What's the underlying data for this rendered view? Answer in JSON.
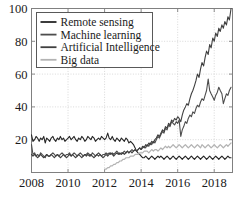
{
  "chart_data": {
    "type": "line",
    "title": "",
    "xlabel": "",
    "ylabel": "",
    "xlim": [
      2008,
      2019
    ],
    "ylim": [
      0,
      100
    ],
    "grid": true,
    "legend_position": "top-left",
    "xticks": [
      "2008",
      "2010",
      "2012",
      "2014",
      "2016",
      "2018"
    ],
    "xtick_values": [
      2008,
      2010,
      2012,
      2014,
      2016,
      2018
    ],
    "yticks": [
      "20",
      "40",
      "60",
      "80",
      "100"
    ],
    "ytick_values": [
      20,
      40,
      60,
      80,
      100
    ],
    "x": [
      2008.0,
      2008.08,
      2008.17,
      2008.25,
      2008.33,
      2008.42,
      2008.5,
      2008.58,
      2008.67,
      2008.75,
      2008.83,
      2008.92,
      2009.0,
      2009.08,
      2009.17,
      2009.25,
      2009.33,
      2009.42,
      2009.5,
      2009.58,
      2009.67,
      2009.75,
      2009.83,
      2009.92,
      2010.0,
      2010.08,
      2010.17,
      2010.25,
      2010.33,
      2010.42,
      2010.5,
      2010.58,
      2010.67,
      2010.75,
      2010.83,
      2010.92,
      2011.0,
      2011.08,
      2011.17,
      2011.25,
      2011.33,
      2011.42,
      2011.5,
      2011.58,
      2011.67,
      2011.75,
      2011.83,
      2011.92,
      2012.0,
      2012.08,
      2012.17,
      2012.25,
      2012.33,
      2012.42,
      2012.5,
      2012.58,
      2012.67,
      2012.75,
      2012.83,
      2012.92,
      2013.0,
      2013.08,
      2013.17,
      2013.25,
      2013.33,
      2013.42,
      2013.5,
      2013.58,
      2013.67,
      2013.75,
      2013.83,
      2013.92,
      2014.0,
      2014.08,
      2014.17,
      2014.25,
      2014.33,
      2014.42,
      2014.5,
      2014.58,
      2014.67,
      2014.75,
      2014.83,
      2014.92,
      2015.0,
      2015.08,
      2015.17,
      2015.25,
      2015.33,
      2015.42,
      2015.5,
      2015.58,
      2015.67,
      2015.75,
      2015.83,
      2015.92,
      2016.0,
      2016.08,
      2016.17,
      2016.25,
      2016.33,
      2016.42,
      2016.5,
      2016.58,
      2016.67,
      2016.75,
      2016.83,
      2016.92,
      2017.0,
      2017.08,
      2017.17,
      2017.25,
      2017.33,
      2017.42,
      2017.5,
      2017.58,
      2017.67,
      2017.75,
      2017.83,
      2017.92,
      2018.0,
      2018.08,
      2018.17,
      2018.25,
      2018.33,
      2018.42,
      2018.5,
      2018.58,
      2018.67,
      2018.75,
      2018.83,
      2018.92
    ],
    "series": [
      {
        "name": "Remote sensing",
        "color": "#262626",
        "width": 1.1,
        "values": [
          23,
          19,
          20,
          22,
          21,
          19,
          21,
          20,
          22,
          18,
          21,
          20,
          19,
          21,
          22,
          20,
          19,
          21,
          20,
          22,
          20,
          21,
          19,
          20,
          21,
          22,
          20,
          21,
          22,
          20,
          19,
          21,
          20,
          22,
          21,
          19,
          20,
          22,
          21,
          20,
          22,
          21,
          19,
          20,
          21,
          20,
          22,
          21,
          20,
          21,
          24,
          21,
          20,
          22,
          20,
          19,
          21,
          20,
          19,
          21,
          20,
          19,
          21,
          20,
          18,
          19,
          18,
          17,
          15,
          13,
          12,
          11,
          10,
          9,
          9,
          10,
          9,
          8,
          9,
          10,
          9,
          8,
          9,
          10,
          9,
          10,
          9,
          8,
          9,
          10,
          9,
          8,
          9,
          10,
          9,
          8,
          9,
          10,
          9,
          8,
          9,
          10,
          9,
          8,
          9,
          10,
          9,
          8,
          9,
          10,
          9,
          8,
          9,
          10,
          9,
          8,
          9,
          10,
          9,
          8,
          9,
          10,
          9,
          8,
          9,
          10,
          9,
          8,
          9,
          10,
          9,
          9
        ]
      },
      {
        "name": "Machine learning",
        "color": "#4d4d4d",
        "width": 1.1,
        "values": [
          17,
          11,
          12,
          10,
          11,
          10,
          12,
          11,
          10,
          9,
          11,
          10,
          10,
          11,
          12,
          11,
          10,
          11,
          10,
          11,
          12,
          11,
          10,
          11,
          11,
          12,
          10,
          11,
          12,
          11,
          10,
          11,
          12,
          11,
          10,
          11,
          11,
          12,
          11,
          10,
          12,
          11,
          10,
          11,
          12,
          11,
          10,
          11,
          11,
          12,
          11,
          12,
          11,
          12,
          11,
          12,
          13,
          12,
          11,
          12,
          12,
          13,
          12,
          13,
          12,
          13,
          14,
          13,
          14,
          13,
          14,
          15,
          14,
          15,
          16,
          15,
          17,
          16,
          18,
          17,
          19,
          18,
          20,
          22,
          21,
          23,
          25,
          24,
          27,
          26,
          29,
          28,
          31,
          30,
          29,
          31,
          30,
          32,
          22,
          26,
          28,
          31,
          30,
          33,
          35,
          34,
          37,
          36,
          39,
          41,
          40,
          43,
          45,
          44,
          47,
          50,
          57,
          50,
          48,
          46,
          44,
          47,
          49,
          52,
          50,
          48,
          42,
          45,
          48,
          47,
          50,
          52
        ]
      },
      {
        "name": "Artificial Intelligence",
        "color": "#404040",
        "width": 1.1,
        "values": [
          11,
          10,
          11,
          10,
          9,
          10,
          11,
          10,
          9,
          10,
          11,
          10,
          10,
          11,
          10,
          9,
          10,
          11,
          10,
          9,
          10,
          11,
          10,
          9,
          10,
          11,
          10,
          11,
          10,
          9,
          10,
          11,
          10,
          9,
          10,
          11,
          10,
          11,
          10,
          11,
          10,
          9,
          10,
          11,
          10,
          11,
          10,
          9,
          10,
          11,
          10,
          11,
          12,
          11,
          10,
          11,
          12,
          11,
          12,
          11,
          12,
          11,
          12,
          13,
          12,
          13,
          12,
          13,
          14,
          13,
          14,
          15,
          14,
          16,
          15,
          17,
          16,
          18,
          17,
          19,
          18,
          20,
          21,
          23,
          22,
          24,
          26,
          25,
          28,
          27,
          30,
          29,
          32,
          31,
          33,
          32,
          34,
          33,
          31,
          35,
          38,
          40,
          42,
          41,
          45,
          48,
          50,
          53,
          56,
          60,
          58,
          63,
          67,
          65,
          70,
          74,
          72,
          78,
          76,
          82,
          80,
          85,
          83,
          88,
          86,
          90,
          88,
          92,
          90,
          95,
          93,
          100
        ]
      },
      {
        "name": "Big data",
        "color": "#b3b3b3",
        "width": 1.2,
        "values": [
          null,
          null,
          null,
          null,
          null,
          null,
          null,
          null,
          null,
          null,
          null,
          null,
          null,
          null,
          null,
          null,
          null,
          null,
          null,
          null,
          null,
          null,
          null,
          null,
          null,
          null,
          null,
          null,
          null,
          null,
          null,
          null,
          null,
          null,
          null,
          null,
          null,
          null,
          null,
          null,
          null,
          null,
          null,
          null,
          null,
          null,
          null,
          null,
          2,
          2,
          3,
          3,
          4,
          4,
          5,
          5,
          6,
          6,
          7,
          7,
          8,
          8,
          9,
          9,
          9,
          10,
          10,
          10,
          11,
          11,
          11,
          12,
          12,
          12,
          13,
          13,
          13,
          12,
          13,
          14,
          13,
          14,
          14,
          13,
          14,
          15,
          14,
          15,
          16,
          15,
          16,
          15,
          16,
          17,
          16,
          15,
          16,
          17,
          16,
          15,
          16,
          17,
          16,
          15,
          16,
          17,
          16,
          15,
          16,
          17,
          16,
          15,
          17,
          16,
          15,
          16,
          17,
          16,
          15,
          16,
          17,
          16,
          15,
          16,
          17,
          16,
          15,
          16,
          17,
          16,
          17,
          18
        ]
      }
    ]
  },
  "legend": {
    "entries": [
      {
        "label": "Remote sensing",
        "color": "#262626"
      },
      {
        "label": "Machine learning",
        "color": "#4d4d4d"
      },
      {
        "label": "Artificial Intelligence",
        "color": "#404040"
      },
      {
        "label": "Big data",
        "color": "#b3b3b3"
      }
    ]
  },
  "axes": {
    "frame_color": "#808080",
    "grid_color": "#c8c8c8",
    "text_color": "#1a1a1a"
  }
}
